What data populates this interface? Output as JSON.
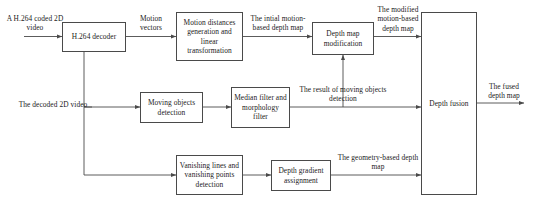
{
  "diagram": {
    "colors": {
      "stroke": "#4a4a4a",
      "text": "#1b1b1b",
      "background": "#ffffff"
    },
    "nodes": [
      {
        "id": "h264-decoder",
        "label": "H.264 decoder"
      },
      {
        "id": "motion-distances",
        "label": "Motion distances generation and linear transformation"
      },
      {
        "id": "depth-map-modification",
        "label": "Depth map modification"
      },
      {
        "id": "moving-objects-detection",
        "label": "Moving objects detection"
      },
      {
        "id": "median-morphology-filter",
        "label": "Median filter and morphology filter"
      },
      {
        "id": "vanishing-detection",
        "label": "Vanishing lines and vanishing points detection"
      },
      {
        "id": "depth-gradient-assignment",
        "label": "Depth gradient assignment"
      },
      {
        "id": "depth-fusion",
        "label": "Depth fusion"
      }
    ],
    "inputs": [
      {
        "id": "input-coded-video",
        "label": "A H.264 coded 2D video"
      },
      {
        "id": "input-decoded-video",
        "label": "The decoded 2D video"
      }
    ],
    "outputs": [
      {
        "id": "output-fused-depth-map",
        "label": "The fused depth map"
      }
    ],
    "edge_labels": [
      {
        "id": "motion-vectors",
        "label": "Motion vectors"
      },
      {
        "id": "initial-motion-depth-map",
        "label": "The intial motion-based depth map"
      },
      {
        "id": "modified-motion-depth-map",
        "label": "The modified motion-based depth map"
      },
      {
        "id": "moving-objects-result",
        "label": "The result of moving objects detection"
      },
      {
        "id": "geometry-depth-map",
        "label": "The geometry-based depth map"
      }
    ]
  }
}
